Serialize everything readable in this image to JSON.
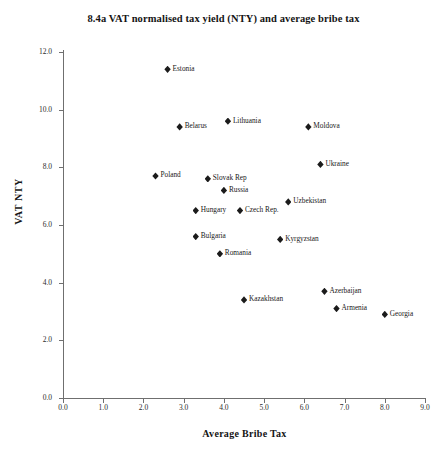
{
  "chart_data": {
    "type": "scatter",
    "title": "8.4a VAT normalised tax yield (NTY) and average bribe tax",
    "xlabel": "Average Bribe Tax",
    "ylabel": "VAT NTY",
    "xlim": [
      0.0,
      9.0
    ],
    "ylim": [
      0.0,
      12.0
    ],
    "xticks": [
      "0.0",
      "1.0",
      "2.0",
      "3.0",
      "4.0",
      "5.0",
      "6.0",
      "7.0",
      "8.0",
      "9.0"
    ],
    "yticks": [
      "0.0",
      "2.0",
      "4.0",
      "6.0",
      "8.0",
      "10.0",
      "12.0"
    ],
    "grid": false,
    "legend": "none",
    "marker": "diamond",
    "marker_color": "#1b1b1b",
    "points": [
      {
        "label": "Estonia",
        "x": 2.6,
        "y": 11.4
      },
      {
        "label": "Belarus",
        "x": 2.9,
        "y": 9.4
      },
      {
        "label": "Lithuania",
        "x": 4.1,
        "y": 9.6
      },
      {
        "label": "Moldova",
        "x": 6.1,
        "y": 9.4
      },
      {
        "label": "Ukraine",
        "x": 6.4,
        "y": 8.1
      },
      {
        "label": "Poland",
        "x": 2.3,
        "y": 7.7
      },
      {
        "label": "Slovak Rep",
        "x": 3.6,
        "y": 7.6
      },
      {
        "label": "Russia",
        "x": 4.0,
        "y": 7.2
      },
      {
        "label": "Uzbekistan",
        "x": 5.6,
        "y": 6.8
      },
      {
        "label": "Hungary",
        "x": 3.3,
        "y": 6.5
      },
      {
        "label": "Czech Rep.",
        "x": 4.4,
        "y": 6.5
      },
      {
        "label": "Bulgaria",
        "x": 3.3,
        "y": 5.6
      },
      {
        "label": "Kyrgyzstan",
        "x": 5.4,
        "y": 5.5
      },
      {
        "label": "Romania",
        "x": 3.9,
        "y": 5.0
      },
      {
        "label": "Azerbaijan",
        "x": 6.5,
        "y": 3.7
      },
      {
        "label": "Kazakhstan",
        "x": 4.5,
        "y": 3.4
      },
      {
        "label": "Armenia",
        "x": 6.8,
        "y": 3.1
      },
      {
        "label": "Georgia",
        "x": 8.0,
        "y": 2.9
      }
    ]
  }
}
